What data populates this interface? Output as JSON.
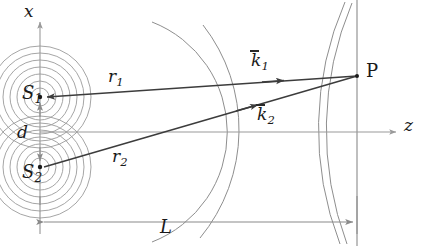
{
  "figure": {
    "background_color": "#ffffff",
    "labels": {
      "x_axis": "x",
      "z_axis": "z",
      "source_1": "S",
      "source_1_sub": "1",
      "source_2": "S",
      "source_2_sub": "2",
      "separation": "d",
      "ray_1": "r",
      "ray_1_sub": "1",
      "ray_2": "r",
      "ray_2_sub": "2",
      "wavevector_1": "k",
      "wavevector_1_sub": "1",
      "wavevector_2": "k",
      "wavevector_2_sub": "2",
      "point": "P",
      "distance": "L"
    },
    "colors": {
      "axis": "#9a9a9a",
      "ray": "#3c3c3c",
      "wavefront": "#8e8e8e",
      "ripple": "#9b9b9b",
      "screen": "#8a8a8a",
      "dimension": "#8a8a8a",
      "text": "#1a1a1a"
    },
    "geometry": {
      "source_1": {
        "x": 40,
        "y": 97
      },
      "source_2": {
        "x": 40,
        "y": 167
      },
      "point_P": {
        "x": 357,
        "y": 76
      },
      "origin": {
        "x": 40,
        "y": 132
      },
      "screen_x": 357,
      "x_axis_top_y": 20,
      "z_axis_right_x": 398,
      "dimension_line_y": 222,
      "dimension_from_x": 40,
      "dimension_to_x": 357,
      "ripple_radii": [
        9,
        16,
        23,
        30,
        37,
        44,
        51
      ],
      "wavefront_arc_radii": [
        118,
        170
      ],
      "screen_arc_radii": [
        318,
        326
      ]
    }
  }
}
